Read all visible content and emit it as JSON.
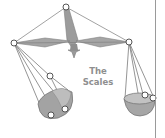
{
  "caption": {
    "line1": "The",
    "line2": "Scales"
  },
  "illustration": {
    "subject": "balance-scale-icon",
    "colors": {
      "beam": "#9a9a9a",
      "beam_dark": "#7f7f7f",
      "string": "#7a7a7a",
      "pan_fill": "#a8a8a8",
      "pan_inner": "#c4c4c4",
      "ring_stroke": "#555555",
      "caption": "#8f8f8f",
      "divider": "#9a9a9a"
    }
  }
}
